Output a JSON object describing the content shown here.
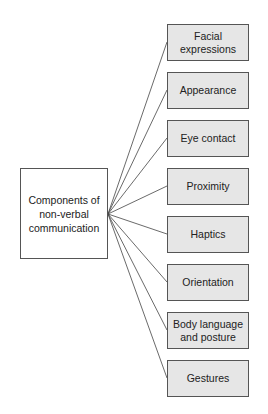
{
  "diagram": {
    "root": {
      "label": "Components of non-verbal communication"
    },
    "children": [
      {
        "label": "Facial expressions"
      },
      {
        "label": "Appearance"
      },
      {
        "label": "Eye contact"
      },
      {
        "label": "Proximity"
      },
      {
        "label": "Haptics"
      },
      {
        "label": "Orientation"
      },
      {
        "label": "Body language and posture"
      },
      {
        "label": "Gestures"
      }
    ],
    "colors": {
      "root_fill": "#ffffff",
      "leaf_fill": "#e6e6e6",
      "stroke": "#555555"
    }
  }
}
